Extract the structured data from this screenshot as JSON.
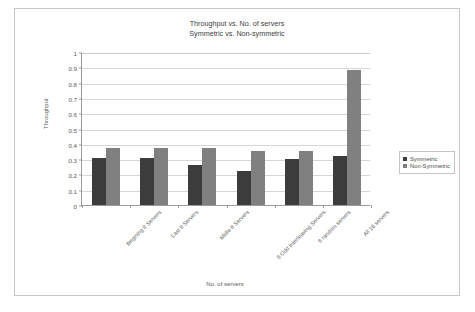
{
  "chart_data": {
    "type": "bar",
    "title": "Throughput vs. No. of servers",
    "subtitle": "Symmetric vs. Non-symmetric",
    "title_lines": [
      "Throughput vs. No. of servers",
      "Symmetric vs. Non-symmetric"
    ],
    "xlabel": "No. of servers",
    "ylabel": "Throughput",
    "ylim": [
      0,
      1
    ],
    "ytick_labels": [
      "1",
      "0.9",
      "0.8",
      "0.7",
      "0.6",
      "0.5",
      "0.4",
      "0.3",
      "0.2",
      "0.1",
      "0"
    ],
    "ytick_values": [
      1,
      0.9,
      0.8,
      0.7,
      0.6,
      0.5,
      0.4,
      0.3,
      0.2,
      0.1,
      0
    ],
    "grid": "horizontal",
    "legend_position": "right",
    "categories": [
      "Begining 8 Servers",
      "Last 8 Servers",
      "Midle 8 Servers",
      "8 Odd Interleaving Servers",
      "8 random servers",
      "All 16 servers"
    ],
    "series": [
      {
        "name": "Symmetric",
        "color": "#3c3c3c",
        "values": [
          0.31,
          0.31,
          0.26,
          0.22,
          0.3,
          0.32
        ]
      },
      {
        "name": "Non-Symmetric",
        "color": "#808080",
        "values": [
          0.37,
          0.37,
          0.37,
          0.35,
          0.35,
          0.88
        ]
      }
    ]
  },
  "legend": {
    "items": [
      {
        "label": "Symmetric",
        "color": "#3c3c3c"
      },
      {
        "label": "Non-Symmetric",
        "color": "#808080"
      }
    ]
  },
  "colors": {
    "symmetric": "#3c3c3c",
    "non_symmetric": "#808080",
    "grid": "#d6d6d6",
    "axis": "#9a9a9a",
    "frame": "#c8c8c8"
  }
}
